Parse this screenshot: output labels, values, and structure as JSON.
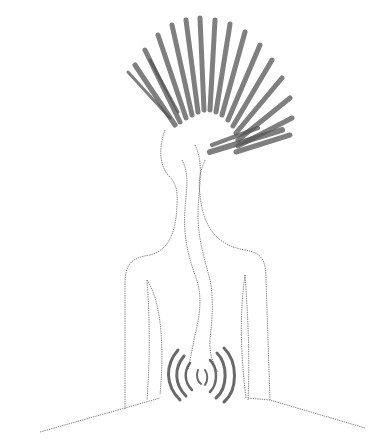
{
  "image": {
    "description": "Pencil sketch of a human figure outline whose head dissolves into a fan of radiating strokes; a wavy channel runs from the head down through the torso to a cluster of concentric arcs in the lower abdomen.",
    "colors": {
      "background": "#ffffff",
      "line": "#777777",
      "shading": "#444444"
    },
    "elements": [
      "radiating-head-strokes",
      "figure-outline",
      "wavy-spine-channel",
      "concentric-arcs",
      "ground-lines"
    ]
  }
}
